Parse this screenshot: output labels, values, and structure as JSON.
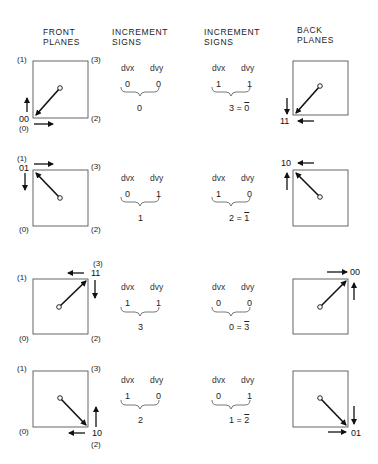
{
  "headers": {
    "front_planes_line1": "FRONT",
    "front_planes_line2": "PLANES",
    "increment_signs_1_line1": "INCREMENT",
    "increment_signs_1_line2": "SIGNS",
    "increment_signs_2_line1": "INCREMENT",
    "increment_signs_2_line2": "SIGNS",
    "back_planes_line1": "BACK",
    "back_planes_line2": "PLANES"
  },
  "corner_labels": {
    "c0": "(0)",
    "c1": "(1)",
    "c2": "(2)",
    "c3": "(3)"
  },
  "rows": [
    {
      "front_code": "00",
      "front_inc": {
        "dvx_label": "dvx",
        "dvy_label": "dvy",
        "dvx": "0",
        "dvy": "0",
        "result": "0"
      },
      "back_inc": {
        "dvx_label": "dvx",
        "dvy_label": "dvy",
        "dvx": "1",
        "dvy": "1",
        "result_left": "3 = ",
        "result_right": "0"
      },
      "back_code": "11"
    },
    {
      "front_code": "01",
      "front_inc": {
        "dvx_label": "dvx",
        "dvy_label": "dvy",
        "dvx": "0",
        "dvy": "1",
        "result": "1"
      },
      "back_inc": {
        "dvx_label": "dvx",
        "dvy_label": "dvy",
        "dvx": "1",
        "dvy": "0",
        "result_left": "2 = ",
        "result_right": "1"
      },
      "back_code": "10"
    },
    {
      "front_code": "11",
      "front_inc": {
        "dvx_label": "dvx",
        "dvy_label": "dvy",
        "dvx": "1",
        "dvy": "1",
        "result": "3"
      },
      "back_inc": {
        "dvx_label": "dvx",
        "dvy_label": "dvy",
        "dvx": "0",
        "dvy": "0",
        "result_left": "0 = ",
        "result_right": "3"
      },
      "back_code": "00"
    },
    {
      "front_code": "10",
      "front_inc": {
        "dvx_label": "dvx",
        "dvy_label": "dvy",
        "dvx": "1",
        "dvy": "0",
        "result": "2"
      },
      "back_inc": {
        "dvx_label": "dvx",
        "dvy_label": "dvy",
        "dvx": "0",
        "dvy": "1",
        "result_left": "1 = ",
        "result_right": "2"
      },
      "back_code": "01"
    }
  ]
}
